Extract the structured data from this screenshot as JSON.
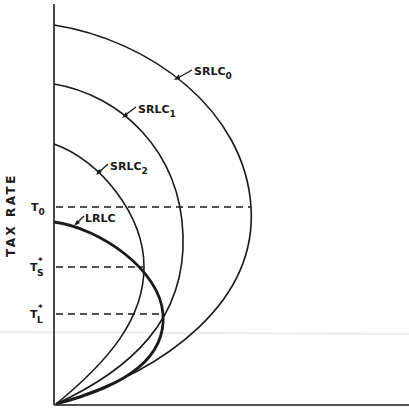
{
  "figure": {
    "y_axis_label": "TAX RATE",
    "x_axis_label": ""
  },
  "curves": {
    "srlc0": {
      "label": "SRLC",
      "sub": "0"
    },
    "srlc1": {
      "label": "SRLC",
      "sub": "1"
    },
    "srlc2": {
      "label": "SRLC",
      "sub": "2"
    },
    "lrlc": {
      "label": "LRLC"
    }
  },
  "levels": {
    "t0": {
      "label": "T",
      "sub": "0"
    },
    "ts": {
      "label": "T",
      "sup": "*",
      "sub": "S"
    },
    "tl": {
      "label": "T",
      "sup": "*",
      "sub": "L"
    }
  },
  "colors": {
    "ink": "#1a1a1a",
    "background": "#ffffff"
  }
}
